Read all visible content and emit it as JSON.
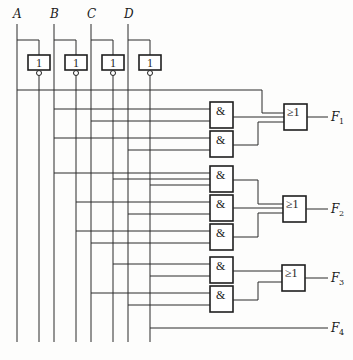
{
  "diagram": {
    "type": "logic-circuit",
    "inputs": [
      {
        "name": "A",
        "x": 17
      },
      {
        "name": "B",
        "x": 54
      },
      {
        "name": "C",
        "x": 91
      },
      {
        "name": "D",
        "x": 128
      }
    ],
    "not_gates": [
      {
        "id": "not-a",
        "symbol": "1",
        "input": "A"
      },
      {
        "id": "not-b",
        "symbol": "1",
        "input": "B"
      },
      {
        "id": "not-c",
        "symbol": "1",
        "input": "C"
      },
      {
        "id": "not-d",
        "symbol": "1",
        "input": "D"
      }
    ],
    "and_gates": [
      {
        "id": "and-1",
        "symbol": "&"
      },
      {
        "id": "and-2",
        "symbol": "&"
      },
      {
        "id": "and-3",
        "symbol": "&"
      },
      {
        "id": "and-4",
        "symbol": "&"
      },
      {
        "id": "and-5",
        "symbol": "&"
      },
      {
        "id": "and-6",
        "symbol": "&"
      },
      {
        "id": "and-7",
        "symbol": "&"
      }
    ],
    "or_gates": [
      {
        "id": "or-1",
        "symbol": "≥1",
        "output": "F1"
      },
      {
        "id": "or-2",
        "symbol": "≥1",
        "output": "F2"
      },
      {
        "id": "or-3",
        "symbol": "≥1",
        "output": "F3"
      }
    ],
    "outputs": [
      {
        "letter": "F",
        "sub": "1"
      },
      {
        "letter": "F",
        "sub": "2"
      },
      {
        "letter": "F",
        "sub": "3"
      },
      {
        "letter": "F",
        "sub": "4"
      }
    ]
  }
}
